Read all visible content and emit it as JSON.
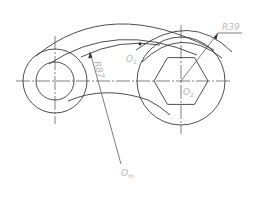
{
  "drawing": {
    "title": "Linkage plate with two bosses and hex socket",
    "labels": {
      "radius_R39": "R39",
      "radius_R87": "R87",
      "center_O1": "O",
      "center_O1_sub": "1",
      "center_O2": "O",
      "center_O2_sub": "2",
      "center_Om": "O",
      "center_Om_sub": "m"
    },
    "colors": {
      "stroke": "#3a3a3a",
      "label": "#b8b8b8",
      "background": "#ffffff"
    }
  }
}
